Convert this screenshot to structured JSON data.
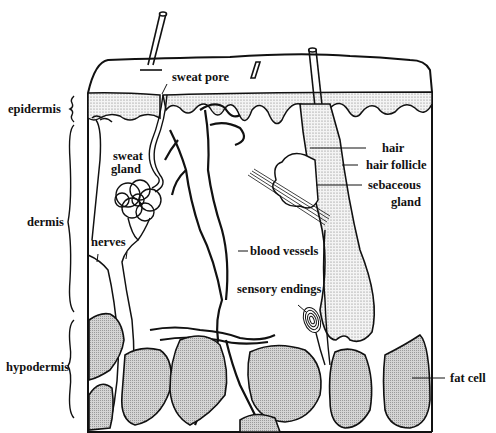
{
  "diagram": {
    "layers": [
      {
        "id": "epidermis",
        "label": "epidermis"
      },
      {
        "id": "dermis",
        "label": "dermis"
      },
      {
        "id": "hypodermis",
        "label": "hypodermis"
      }
    ],
    "structures": [
      {
        "id": "sweat-pore",
        "label": "sweat pore"
      },
      {
        "id": "sweat-gland",
        "label": "sweat\ngland",
        "line1": "sweat",
        "line2": "gland"
      },
      {
        "id": "nerves",
        "label": "nerves"
      },
      {
        "id": "blood-vessels",
        "label": "blood vessels"
      },
      {
        "id": "hair",
        "label": "hair"
      },
      {
        "id": "hair-follicle",
        "label": "hair follicle"
      },
      {
        "id": "sebaceous-gland",
        "label": "sebaceous gland",
        "line1": "sebaceous",
        "line2": "gland"
      },
      {
        "id": "sensory-endings",
        "label": "sensory endings"
      },
      {
        "id": "fat-cell",
        "label": "fat cell"
      }
    ],
    "colors": {
      "ink": "#111111",
      "background": "#ffffff",
      "fat_fill": "#cfcfcf",
      "epidermis_fill": "#e6e6e6"
    }
  }
}
